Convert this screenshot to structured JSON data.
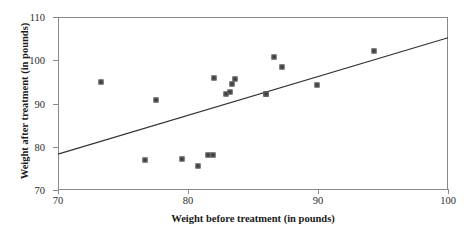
{
  "chart_data": {
    "type": "scatter",
    "title": "",
    "xlabel": "Weight before treatment (in pounds)",
    "ylabel": "Weight after treatment (in pounds)",
    "xlim": [
      70,
      100
    ],
    "ylim": [
      70,
      110
    ],
    "xticks": [
      70,
      80,
      90,
      100
    ],
    "yticks": [
      70,
      80,
      90,
      100,
      110
    ],
    "grid": false,
    "legend": null,
    "marker": "small filled square",
    "point_color": "#3b3b3b",
    "axis_color": "#8a8a8a",
    "line_color": "#333333",
    "x": [
      73.3,
      77.5,
      76.7,
      79.5,
      80.8,
      81.5,
      81.9,
      82.0,
      82.9,
      83.2,
      83.4,
      83.6,
      86.0,
      86.0,
      86.6,
      87.2,
      89.9,
      94.3
    ],
    "y": [
      94.9,
      90.9,
      77.0,
      77.1,
      75.5,
      78.0,
      78.1,
      95.8,
      92.3,
      92.7,
      94.6,
      95.7,
      92.1,
      92.2,
      100.8,
      98.4,
      94.3,
      102.1
    ],
    "points": [
      {
        "x": 73.3,
        "y": 94.9
      },
      {
        "x": 77.5,
        "y": 90.9
      },
      {
        "x": 76.7,
        "y": 77.0
      },
      {
        "x": 79.5,
        "y": 77.1
      },
      {
        "x": 80.8,
        "y": 75.5
      },
      {
        "x": 81.5,
        "y": 78.0
      },
      {
        "x": 81.9,
        "y": 78.1
      },
      {
        "x": 82.0,
        "y": 95.8
      },
      {
        "x": 82.9,
        "y": 92.3
      },
      {
        "x": 83.2,
        "y": 92.7
      },
      {
        "x": 83.4,
        "y": 94.6
      },
      {
        "x": 83.6,
        "y": 95.7
      },
      {
        "x": 86.0,
        "y": 92.1
      },
      {
        "x": 86.0,
        "y": 92.2
      },
      {
        "x": 86.6,
        "y": 100.8
      },
      {
        "x": 87.2,
        "y": 98.4
      },
      {
        "x": 89.9,
        "y": 94.3
      },
      {
        "x": 94.3,
        "y": 102.1
      }
    ],
    "trend_line": {
      "x0": 70,
      "y0": 78.3,
      "x1": 100,
      "y1": 105.2
    }
  }
}
